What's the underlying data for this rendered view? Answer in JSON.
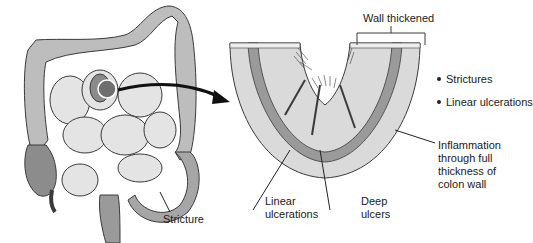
{
  "diagram": {
    "labels": {
      "wall_thickened": "Wall thickened",
      "stricture": "Stricture",
      "linear_ulcerations": [
        "Linear",
        "ulcerations"
      ],
      "deep_ulcers": [
        "Deep",
        "ulcers"
      ],
      "inflammation": [
        "Inflammation",
        "through full",
        "thickness of",
        "colon wall"
      ]
    },
    "bullets": [
      "Strictures",
      "Linear ulcerations"
    ],
    "colors": {
      "colon": "#b9b9b9",
      "colon_dark": "#8c8c8c",
      "small_intestine": "#e4e4e4",
      "outline": "#3a3a3a",
      "wall_section": "#d9d9d9",
      "muscle_layer": "#9a9a9a",
      "arrow": "#111111"
    }
  }
}
